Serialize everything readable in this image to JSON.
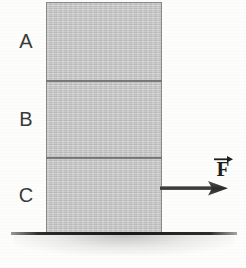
{
  "figure": {
    "background_color": "#fdfdfc",
    "width": 246,
    "height": 268
  },
  "blocks": {
    "fill_color": "#c4c4c4",
    "border_color": "#5a5a5a",
    "items": [
      {
        "label": "A",
        "position": "top"
      },
      {
        "label": "B",
        "position": "middle"
      },
      {
        "label": "C",
        "position": "bottom"
      }
    ]
  },
  "force": {
    "label": "F",
    "vector_notation": "arrow-over-letter",
    "direction": "right",
    "applied_to": "C",
    "arrow_color": "#3c3c3c"
  },
  "ground": {
    "label": "",
    "line_color": "#1e1e1e"
  }
}
